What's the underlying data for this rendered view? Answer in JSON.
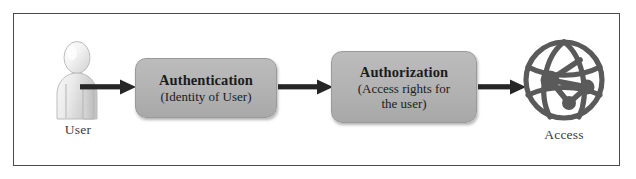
{
  "diagram": {
    "frame": {
      "border_color": "#4a4a4a",
      "background": "#ffffff"
    },
    "colors": {
      "box_fill": "#b2b2b2",
      "box_border": "#9a9a9a",
      "box_text": "#1c1c1c",
      "arrow": "#262626",
      "label_text": "#3b3b3b",
      "access_icon": "#5a5a5a",
      "user_icon": "#e8e8e8"
    },
    "nodes": {
      "user": {
        "icon": "user-person-icon",
        "label": "User"
      },
      "authentication": {
        "title": "Authentication",
        "subtitle": "(Identity of User)"
      },
      "authorization": {
        "title": "Authorization",
        "subtitle_line1": "(Access rights for",
        "subtitle_line2": "the user)"
      },
      "access": {
        "icon": "globe-network-icon",
        "label": "Access"
      }
    },
    "arrows": [
      {
        "name": "arrow-user-to-authentication",
        "from": "user",
        "to": "authentication",
        "direction": "right"
      },
      {
        "name": "arrow-authentication-to-authorization",
        "from": "authentication",
        "to": "authorization",
        "direction": "right"
      },
      {
        "name": "arrow-authorization-to-access",
        "from": "authorization",
        "to": "access",
        "direction": "right"
      }
    ]
  }
}
